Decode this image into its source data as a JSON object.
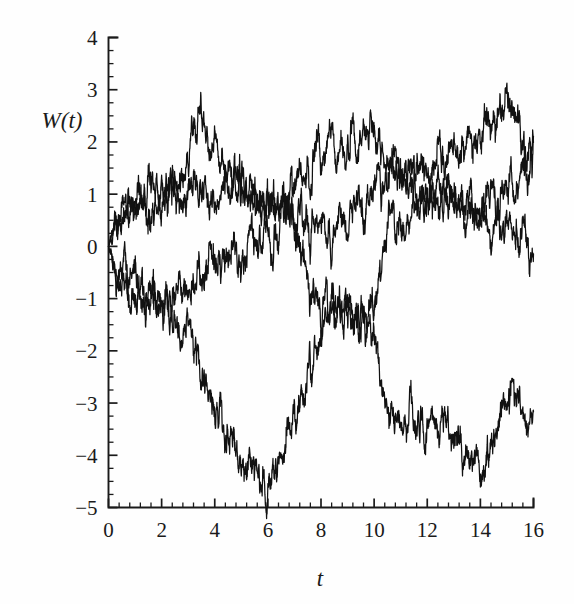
{
  "chart_data": {
    "type": "line",
    "title": "",
    "subtitle": "",
    "xlabel": "t",
    "ylabel": "W(t)",
    "xlim": [
      0,
      16
    ],
    "ylim": [
      -5,
      4
    ],
    "grid": false,
    "legend": "none",
    "annotations": [],
    "x_ticks": [
      0,
      2,
      4,
      6,
      8,
      10,
      12,
      14,
      16
    ],
    "x_tick_labels": [
      "0",
      "2",
      "4",
      "6",
      "8",
      "10",
      "12",
      "14",
      "16"
    ],
    "x_minor_step": 0.4,
    "y_ticks": [
      -5,
      -4,
      -3,
      -2,
      -1,
      0,
      1,
      2,
      3,
      4
    ],
    "y_tick_labels": [
      "-5",
      "-4",
      "-3",
      "-2",
      "-1",
      "0",
      "1",
      "2",
      "3",
      "4"
    ],
    "y_minor_step": 0.25,
    "series": [
      {
        "name": "path-1",
        "color": "#111111",
        "x": [
          0,
          0.2,
          0.4,
          0.6,
          0.8,
          1.0,
          1.2,
          1.4,
          1.6,
          1.8,
          2.0,
          2.2,
          2.4,
          2.6,
          2.8,
          3.0,
          3.2,
          3.4,
          3.6,
          3.8,
          4.0,
          4.2,
          4.4,
          4.6,
          4.8,
          5.0,
          5.2,
          5.4,
          5.6,
          5.8,
          6.0,
          6.2,
          6.4,
          6.6,
          6.8,
          7.0,
          7.2,
          7.4,
          7.6,
          7.8,
          8.0,
          8.2,
          8.4,
          8.6,
          8.8,
          9.0,
          9.2,
          9.4,
          9.6,
          9.8,
          10.0,
          10.2,
          10.4,
          10.6,
          10.8,
          11.0,
          11.2,
          11.4,
          11.6,
          11.8,
          12.0,
          12.2,
          12.4,
          12.6,
          12.8,
          13.0,
          13.2,
          13.4,
          13.6,
          13.8,
          14.0,
          14.2,
          14.4,
          14.6,
          14.8,
          15.0,
          15.2,
          15.4,
          15.6,
          15.8,
          16.0
        ],
        "y": [
          0.0,
          0.45,
          0.62,
          0.55,
          0.78,
          0.62,
          0.95,
          0.72,
          0.55,
          0.85,
          0.7,
          0.95,
          1.25,
          1.1,
          1.35,
          1.6,
          2.05,
          2.62,
          2.2,
          1.95,
          2.1,
          1.75,
          1.5,
          1.62,
          1.3,
          1.05,
          0.88,
          1.15,
          0.95,
          0.72,
          0.9,
          0.62,
          0.85,
          1.05,
          0.78,
          1.15,
          1.5,
          1.25,
          1.55,
          1.85,
          1.6,
          1.85,
          2.05,
          1.7,
          1.95,
          1.75,
          2.05,
          1.8,
          2.2,
          1.95,
          2.2,
          1.85,
          1.6,
          1.3,
          1.5,
          1.2,
          1.45,
          1.7,
          1.4,
          1.65,
          1.35,
          1.6,
          1.85,
          1.55,
          1.8,
          2.05,
          1.75,
          2.0,
          2.25,
          1.95,
          2.2,
          2.5,
          2.25,
          2.55,
          2.8,
          2.92,
          2.6,
          2.2,
          1.85,
          1.6,
          2.0
        ]
      },
      {
        "name": "path-2",
        "color": "#111111",
        "x": [
          0,
          0.2,
          0.4,
          0.6,
          0.8,
          1.0,
          1.2,
          1.4,
          1.6,
          1.8,
          2.0,
          2.2,
          2.4,
          2.6,
          2.8,
          3.0,
          3.2,
          3.4,
          3.6,
          3.8,
          4.0,
          4.2,
          4.4,
          4.6,
          4.8,
          5.0,
          5.2,
          5.4,
          5.6,
          5.8,
          6.0,
          6.2,
          6.4,
          6.6,
          6.8,
          7.0,
          7.2,
          7.4,
          7.6,
          7.8,
          8.0,
          8.2,
          8.4,
          8.6,
          8.8,
          9.0,
          9.2,
          9.4,
          9.6,
          9.8,
          10.0,
          10.2,
          10.4,
          10.6,
          10.8,
          11.0,
          11.2,
          11.4,
          11.6,
          11.8,
          12.0,
          12.2,
          12.4,
          12.6,
          12.8,
          13.0,
          13.2,
          13.4,
          13.6,
          13.8,
          14.0,
          14.2,
          14.4,
          14.6,
          14.8,
          15.0,
          15.2,
          15.4,
          15.6,
          15.8,
          16.0
        ],
        "y": [
          0.0,
          0.35,
          0.72,
          0.85,
          0.62,
          0.95,
          1.12,
          0.88,
          1.15,
          0.95,
          1.2,
          1.0,
          1.25,
          1.1,
          0.85,
          1.1,
          1.3,
          1.05,
          1.25,
          1.0,
          0.75,
          1.0,
          1.2,
          0.95,
          1.2,
          1.4,
          1.15,
          0.9,
          1.15,
          0.9,
          1.1,
          0.85,
          0.6,
          0.85,
          0.6,
          0.35,
          0.6,
          0.35,
          0.15,
          0.4,
          0.65,
          0.4,
          0.15,
          0.4,
          0.6,
          0.35,
          0.6,
          0.85,
          0.6,
          0.85,
          1.1,
          1.35,
          1.1,
          1.35,
          1.6,
          1.35,
          1.1,
          1.35,
          1.15,
          0.9,
          1.15,
          0.9,
          1.1,
          0.85,
          1.1,
          0.85,
          1.1,
          0.85,
          1.1,
          0.85,
          0.6,
          0.85,
          1.05,
          0.8,
          1.05,
          1.3,
          1.05,
          1.3,
          1.5,
          1.3,
          1.6
        ]
      },
      {
        "name": "path-3",
        "color": "#111111",
        "x": [
          0,
          0.2,
          0.4,
          0.6,
          0.8,
          1.0,
          1.2,
          1.4,
          1.6,
          1.8,
          2.0,
          2.2,
          2.4,
          2.6,
          2.8,
          3.0,
          3.2,
          3.4,
          3.6,
          3.8,
          4.0,
          4.2,
          4.4,
          4.6,
          4.8,
          5.0,
          5.2,
          5.4,
          5.6,
          5.8,
          6.0,
          6.2,
          6.4,
          6.6,
          6.8,
          7.0,
          7.2,
          7.4,
          7.6,
          7.8,
          8.0,
          8.2,
          8.4,
          8.6,
          8.8,
          9.0,
          9.2,
          9.4,
          9.6,
          9.8,
          10.0,
          10.2,
          10.4,
          10.6,
          10.8,
          11.0,
          11.2,
          11.4,
          11.6,
          11.8,
          12.0,
          12.2,
          12.4,
          12.6,
          12.8,
          13.0,
          13.2,
          13.4,
          13.6,
          13.8,
          14.0,
          14.2,
          14.4,
          14.6,
          14.8,
          15.0,
          15.2,
          15.4,
          15.6,
          15.8,
          16.0
        ],
        "y": [
          0.0,
          -0.3,
          -0.55,
          -0.35,
          -0.6,
          -0.85,
          -0.65,
          -0.9,
          -0.7,
          -0.95,
          -1.15,
          -0.9,
          -1.1,
          -0.85,
          -0.65,
          -0.85,
          -0.6,
          -0.35,
          -0.55,
          -0.3,
          -0.05,
          -0.3,
          -0.55,
          -0.3,
          -0.05,
          -0.3,
          -0.1,
          0.15,
          -0.1,
          0.15,
          0.4,
          0.15,
          0.4,
          0.6,
          0.8,
          0.55,
          0.3,
          -0.35,
          -0.75,
          -1.0,
          -1.2,
          -0.95,
          -1.2,
          -1.4,
          -1.15,
          -1.4,
          -1.6,
          -1.35,
          -1.55,
          -1.3,
          -1.05,
          -0.45,
          0.2,
          0.55,
          0.35,
          0.6,
          0.35,
          0.6,
          0.85,
          0.6,
          0.85,
          1.1,
          0.85,
          1.1,
          0.85,
          1.1,
          0.85,
          0.6,
          0.85,
          0.6,
          0.35,
          0.6,
          0.35,
          0.6,
          0.35,
          0.6,
          0.35,
          0.1,
          0.3,
          0.05,
          -0.2
        ]
      },
      {
        "name": "path-4",
        "color": "#111111",
        "x": [
          0,
          0.2,
          0.4,
          0.6,
          0.8,
          1.0,
          1.2,
          1.4,
          1.6,
          1.8,
          2.0,
          2.2,
          2.4,
          2.6,
          2.8,
          3.0,
          3.2,
          3.4,
          3.6,
          3.8,
          4.0,
          4.2,
          4.4,
          4.6,
          4.8,
          5.0,
          5.2,
          5.4,
          5.6,
          5.8,
          6.0,
          6.2,
          6.4,
          6.6,
          6.8,
          7.0,
          7.2,
          7.4,
          7.6,
          7.8,
          8.0,
          8.2,
          8.4,
          8.6,
          8.8,
          9.0,
          9.2,
          9.4,
          9.6,
          9.8,
          10.0,
          10.2,
          10.4,
          10.6,
          10.8,
          11.0,
          11.2,
          11.4,
          11.6,
          11.8,
          12.0,
          12.2,
          12.4,
          12.6,
          12.8,
          13.0,
          13.2,
          13.4,
          13.6,
          13.8,
          14.0,
          14.2,
          14.4,
          14.6,
          14.8,
          15.0,
          15.2,
          15.4,
          15.6,
          15.8,
          16.0
        ],
        "y": [
          0.0,
          -0.4,
          -0.7,
          -0.5,
          -0.8,
          -1.05,
          -0.8,
          -1.05,
          -0.85,
          -1.1,
          -1.3,
          -1.1,
          -1.35,
          -1.6,
          -1.85,
          -1.6,
          -1.85,
          -2.1,
          -2.4,
          -2.7,
          -3.0,
          -3.3,
          -3.6,
          -3.4,
          -3.75,
          -4.1,
          -4.3,
          -4.05,
          -4.4,
          -4.75,
          -4.5,
          -4.25,
          -4.0,
          -3.8,
          -3.5,
          -3.2,
          -2.9,
          -2.6,
          -2.3,
          -2.0,
          -1.75,
          -1.5,
          -1.3,
          -1.05,
          -1.3,
          -1.1,
          -1.35,
          -1.15,
          -1.4,
          -1.65,
          -1.9,
          -2.4,
          -2.9,
          -3.2,
          -3.45,
          -3.3,
          -3.55,
          -3.3,
          -3.55,
          -3.35,
          -3.6,
          -3.35,
          -3.6,
          -3.35,
          -3.6,
          -3.85,
          -3.6,
          -3.85,
          -4.1,
          -3.85,
          -4.3,
          -4.05,
          -3.8,
          -3.55,
          -3.3,
          -2.95,
          -2.65,
          -2.95,
          -3.25,
          -3.45,
          -3.15
        ]
      }
    ]
  },
  "axes": {
    "y_axis_label": "W(t)",
    "x_axis_label": "t"
  }
}
